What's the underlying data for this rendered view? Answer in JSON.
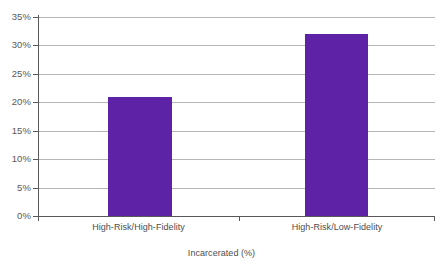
{
  "chart_data": {
    "type": "bar",
    "title": "",
    "subtitle": "",
    "xlabel": "Incarcerated (%)",
    "ylabel": "",
    "categories": [
      "High-Risk/High-Fidelity",
      "High-Risk/Low-Fidelity"
    ],
    "values": [
      21,
      32
    ],
    "series": [
      {
        "name": "Incarcerated (%)",
        "values": [
          21,
          32
        ],
        "color": "#5E22A6"
      }
    ],
    "ylim": [
      0,
      35
    ],
    "ytick_step": 5,
    "ytick_labels": [
      "0%",
      "5%",
      "10%",
      "15%",
      "20%",
      "25%",
      "30%",
      "35%"
    ],
    "ytick_values": [
      0,
      5,
      10,
      15,
      20,
      25,
      30,
      35
    ],
    "grid": "horizontal",
    "legend": "none",
    "annotations": [],
    "background_color": "#FFFFFF",
    "axis_color": "#58585A",
    "gridline_color": "#A9A9A9"
  }
}
